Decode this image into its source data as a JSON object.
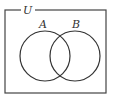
{
  "diagram": {
    "type": "venn",
    "universe_label": "U",
    "sets": [
      {
        "label": "A"
      },
      {
        "label": "B"
      }
    ],
    "colors": {
      "stroke": "#333333",
      "background": "#ffffff"
    }
  }
}
